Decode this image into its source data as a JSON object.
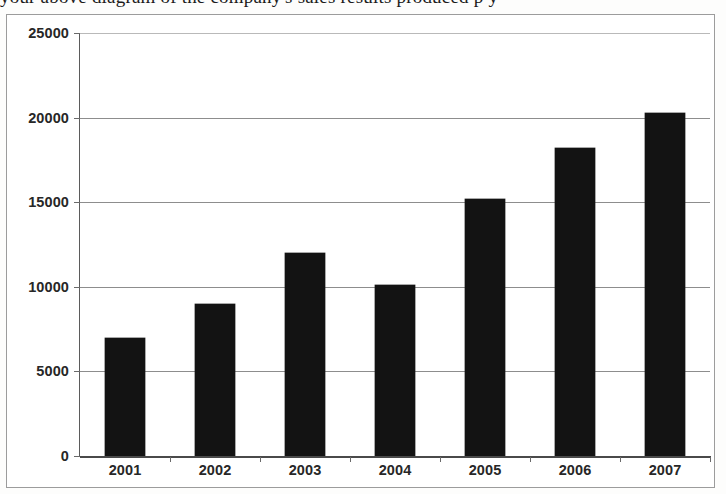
{
  "page": {
    "cut_off_text_top": "your above diagram of the company's sales results produced p   y"
  },
  "chart": {
    "frame_border_color": "#9c9c9c",
    "bar_color": "#131313",
    "gridline_color": "#8d8d8d",
    "axis_color": "#4a4a4a",
    "plot_background": "#ffffff"
  },
  "chart_data": {
    "type": "bar",
    "title": "",
    "xlabel": "",
    "ylabel": "",
    "categories": [
      "2001",
      "2002",
      "2003",
      "2004",
      "2005",
      "2006",
      "2007"
    ],
    "values": [
      7000,
      9000,
      12000,
      10100,
      15200,
      18200,
      20300
    ],
    "series": [
      {
        "name": "",
        "values": [
          7000,
          9000,
          12000,
          10100,
          15200,
          18200,
          20300
        ]
      }
    ],
    "ylim": [
      0,
      25000
    ],
    "ytick_labels": [
      "0",
      "5000",
      "10000",
      "15000",
      "20000",
      "25000"
    ],
    "ytick_values": [
      0,
      5000,
      10000,
      15000,
      20000,
      25000
    ],
    "xtick_labels": [
      "2001",
      "2002",
      "2003",
      "2004",
      "2005",
      "2006",
      "2007"
    ],
    "grid": true,
    "grid_axis": "y",
    "legend": false,
    "legend_position": "none",
    "annotations": []
  }
}
